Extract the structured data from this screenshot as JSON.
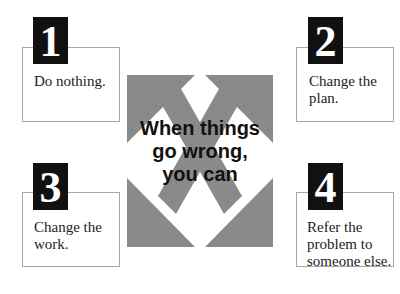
{
  "title": "When things go wrong, you can",
  "title_lines": [
    "When things",
    "go wrong,",
    "you can"
  ],
  "colors": {
    "arrow": "#8a8a8a",
    "tag_bg": "#111111",
    "box_border": "#a8a8a8",
    "text": "#222222"
  },
  "options": [
    {
      "number": "1",
      "text_lines": [
        "Do nothing."
      ]
    },
    {
      "number": "2",
      "text_lines": [
        "Change the",
        "plan."
      ]
    },
    {
      "number": "3",
      "text_lines": [
        "Change the",
        "work."
      ]
    },
    {
      "number": "4",
      "text_lines": [
        "Refer the",
        "problem to",
        "someone else."
      ]
    }
  ]
}
